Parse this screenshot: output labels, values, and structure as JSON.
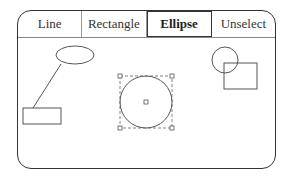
{
  "toolbar": {
    "tools": [
      {
        "label": "Line",
        "active": false
      },
      {
        "label": "Rectangle",
        "active": false
      },
      {
        "label": "Ellipse",
        "active": true
      },
      {
        "label": "Unselect",
        "active": false
      }
    ]
  },
  "canvas": {
    "shapes": [
      {
        "type": "ellipse",
        "cx": 75,
        "cy": 55,
        "rx": 19,
        "ry": 9
      },
      {
        "type": "line",
        "x1": 60,
        "y1": 64,
        "x2": 33,
        "y2": 108
      },
      {
        "type": "rect",
        "x": 23,
        "y": 108,
        "w": 38,
        "h": 16
      },
      {
        "type": "circle",
        "cx": 146,
        "cy": 102,
        "r": 26,
        "selected": true
      },
      {
        "type": "circle",
        "cx": 225,
        "cy": 60,
        "r": 13
      },
      {
        "type": "rect",
        "x": 224,
        "y": 63,
        "w": 33,
        "h": 26
      }
    ]
  }
}
